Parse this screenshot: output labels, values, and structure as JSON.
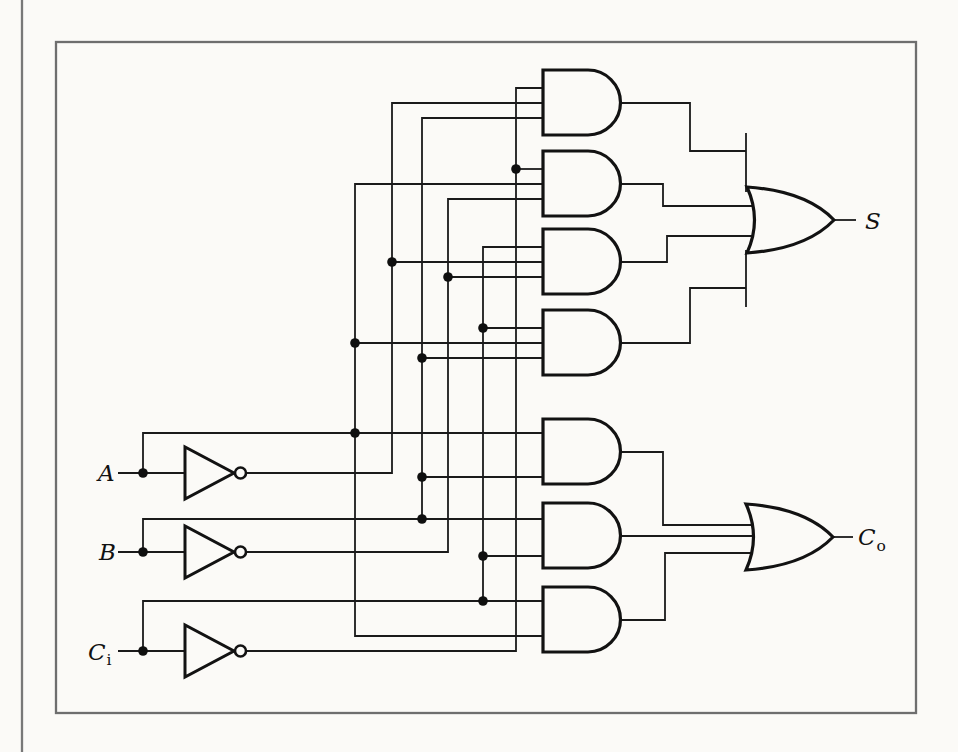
{
  "diagram": {
    "kind": "logic-circuit-schematic"
  },
  "labels": {
    "input_a": {
      "base": "A"
    },
    "input_b": {
      "base": "B"
    },
    "input_carry_in": {
      "base": "C",
      "sub": "i"
    },
    "output_sum": {
      "base": "S"
    },
    "output_carry_out": {
      "base": "C",
      "sub": "o"
    }
  },
  "circuit": {
    "inputs": [
      "A",
      "B",
      "Ci"
    ],
    "outputs": [
      "S",
      "Co"
    ],
    "inverters": [
      {
        "input": "A",
        "output": "A'"
      },
      {
        "input": "B",
        "output": "B'"
      },
      {
        "input": "Ci",
        "output": "Ci'"
      }
    ],
    "and_gates": [
      {
        "id": "and1",
        "inputs": [
          "Ci'",
          "A'",
          "B"
        ],
        "feeds": "or-sum"
      },
      {
        "id": "and2",
        "inputs": [
          "Ci'",
          "A",
          "B'"
        ],
        "feeds": "or-sum"
      },
      {
        "id": "and3",
        "inputs": [
          "Ci",
          "A'",
          "B'"
        ],
        "feeds": "or-sum"
      },
      {
        "id": "and4",
        "inputs": [
          "Ci",
          "A",
          "B"
        ],
        "feeds": "or-sum"
      },
      {
        "id": "and5",
        "inputs": [
          "A",
          "B"
        ],
        "feeds": "or-carry"
      },
      {
        "id": "and6",
        "inputs": [
          "B",
          "Ci"
        ],
        "feeds": "or-carry"
      },
      {
        "id": "and7",
        "inputs": [
          "Ci",
          "A"
        ],
        "feeds": "or-carry"
      }
    ],
    "or_gates": [
      {
        "id": "or-sum",
        "num_inputs": 4,
        "output": "S"
      },
      {
        "id": "or-carry",
        "num_inputs": 3,
        "output": "Co"
      }
    ]
  },
  "colors": {
    "ink": "#1a1a1a",
    "frame": "#6e6e6e",
    "paper": "#fbfaf7"
  }
}
